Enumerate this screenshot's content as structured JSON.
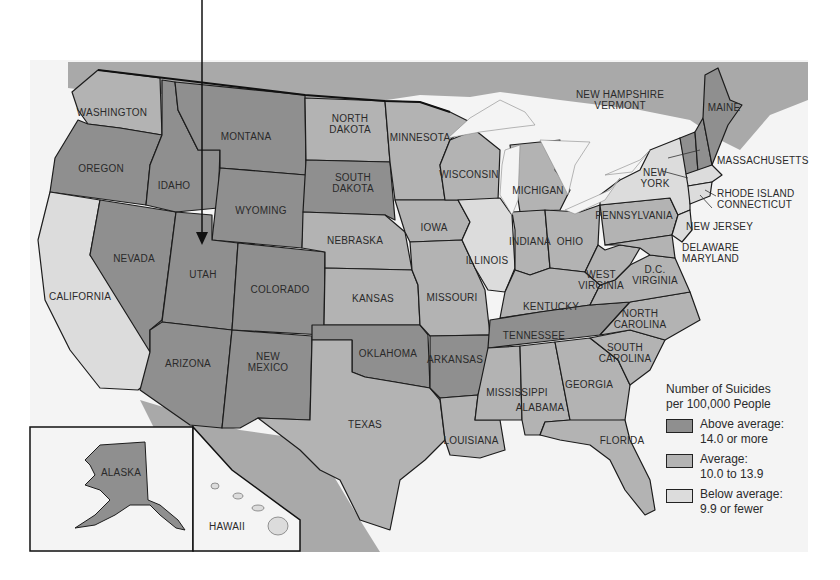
{
  "colors": {
    "above": "#8f8f8f",
    "average": "#b3b3b3",
    "below": "#dcdcdc",
    "foreign": "#a9a9a9",
    "water": "#f4f4f4",
    "border": "#1c1c1c"
  },
  "legend": {
    "title_line1": "Number of Suicides",
    "title_line2": "per 100,000 People",
    "items": [
      {
        "category": "above",
        "label_line1": "Above average:",
        "label_line2": "14.0 or more"
      },
      {
        "category": "average",
        "label_line1": "Average:",
        "label_line2": "10.0 to 13.9"
      },
      {
        "category": "below",
        "label_line1": "Below average:",
        "label_line2": "9.9 or fewer"
      }
    ]
  },
  "states": {
    "washington": "WASHINGTON",
    "oregon": "OREGON",
    "california": "CALIFORNIA",
    "nevada": "NEVADA",
    "idaho": "IDAHO",
    "montana": "MONTANA",
    "wyoming": "WYOMING",
    "utah": "UTAH",
    "colorado": "COLORADO",
    "arizona": "ARIZONA",
    "new_mexico_1": "NEW",
    "new_mexico_2": "MEXICO",
    "north_dakota_1": "NORTH",
    "north_dakota_2": "DAKOTA",
    "south_dakota_1": "SOUTH",
    "south_dakota_2": "DAKOTA",
    "nebraska": "NEBRASKA",
    "kansas": "KANSAS",
    "oklahoma": "OKLAHOMA",
    "texas": "TEXAS",
    "minnesota": "MINNESOTA",
    "iowa": "IOWA",
    "missouri": "MISSOURI",
    "arkansas": "ARKANSAS",
    "louisiana": "LOUISIANA",
    "wisconsin": "WISCONSIN",
    "illinois": "ILLINOIS",
    "michigan": "MICHIGAN",
    "indiana": "INDIANA",
    "ohio": "OHIO",
    "kentucky": "KENTUCKY",
    "tennessee": "TENNESSEE",
    "mississippi": "MISSISSIPPI",
    "alabama": "ALABAMA",
    "georgia": "GEORGIA",
    "florida": "FLORIDA",
    "south_carolina_1": "SOUTH",
    "south_carolina_2": "CAROLINA",
    "north_carolina_1": "NORTH",
    "north_carolina_2": "CAROLINA",
    "virginia": "VIRGINIA",
    "west_virginia_1": "WEST",
    "west_virginia_2": "VIRGINIA",
    "dc": "D.C.",
    "pennsylvania": "PENNSYLVANIA",
    "new_york_1": "NEW",
    "new_york_2": "YORK",
    "new_jersey": "NEW JERSEY",
    "delaware": "DELAWARE",
    "maryland": "MARYLAND",
    "new_hampshire": "NEW HAMPSHIRE",
    "vermont": "VERMONT",
    "maine": "MAINE",
    "massachusetts": "MASSACHUSETTS",
    "rhode_island": "RHODE ISLAND",
    "connecticut": "CONNECTICUT",
    "alaska": "ALASKA",
    "hawaii": "HAWAII"
  },
  "categories": {
    "above": [
      "Montana",
      "Idaho",
      "Oregon",
      "Wyoming",
      "Nevada",
      "Utah",
      "Colorado",
      "Arizona",
      "New Mexico",
      "South Dakota",
      "Oklahoma",
      "Arkansas",
      "Tennessee",
      "Alaska",
      "Maine",
      "Vermont",
      "New Hampshire"
    ],
    "average": [
      "Washington",
      "North Dakota",
      "Minnesota",
      "Wisconsin",
      "Michigan",
      "Nebraska",
      "Iowa",
      "Kansas",
      "Missouri",
      "Texas",
      "Louisiana",
      "Mississippi",
      "Alabama",
      "Georgia",
      "Florida",
      "South Carolina",
      "North Carolina",
      "Virginia",
      "West Virginia",
      "Kentucky",
      "Indiana",
      "Ohio",
      "Pennsylvania",
      "Delaware",
      "Maryland"
    ],
    "below": [
      "California",
      "Illinois",
      "New York",
      "New Jersey",
      "Massachusetts",
      "Rhode Island",
      "Connecticut",
      "Hawaii"
    ]
  }
}
